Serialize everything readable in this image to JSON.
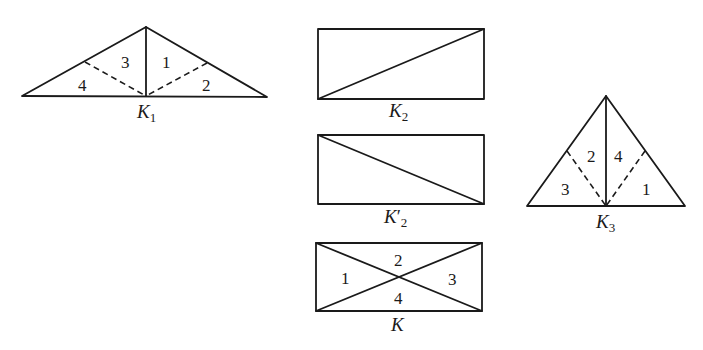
{
  "figure": {
    "K1": {
      "name": "K",
      "subscript": "1",
      "prime": "",
      "shape": "obtuse-triangle",
      "regions": [
        "1",
        "2",
        "3",
        "4"
      ]
    },
    "K2": {
      "name": "K",
      "subscript": "2",
      "prime": "",
      "shape": "rectangle-diagonal-up"
    },
    "K2prime": {
      "name": "K",
      "subscript": "2",
      "prime": "′",
      "shape": "rectangle-diagonal-down"
    },
    "K": {
      "name": "K",
      "subscript": "",
      "prime": "",
      "shape": "rectangle-both-diagonals",
      "regions": [
        "1",
        "2",
        "3",
        "4"
      ]
    },
    "K3": {
      "name": "K",
      "subscript": "3",
      "prime": "",
      "shape": "isosceles-triangle",
      "regions": [
        "2",
        "4",
        "3",
        "1"
      ]
    }
  },
  "colors": {
    "ink": "#1a1a1a",
    "background": "#ffffff"
  }
}
